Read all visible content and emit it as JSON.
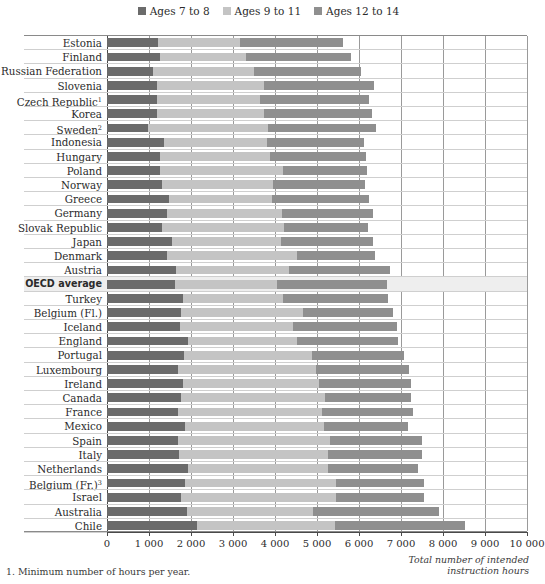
{
  "chart_data": {
    "type": "bar",
    "stacked": true,
    "orientation": "horizontal",
    "title": "",
    "subtitle": "",
    "xlabel": "Total number of intended instruction hours",
    "ylabel": "",
    "xlim": [
      0,
      10000
    ],
    "xticks": [
      0,
      1000,
      2000,
      3000,
      4000,
      5000,
      6000,
      7000,
      8000,
      9000,
      10000
    ],
    "xticklabels": [
      "0",
      "1 000",
      "2 000",
      "3 000",
      "4 000",
      "5 000",
      "6 000",
      "7 000",
      "8 000",
      "9 000",
      "10 000"
    ],
    "grid": "vertical",
    "legend_position": "top-center",
    "legend": [
      {
        "name": "Ages 7 to 8",
        "color": "#6b6b6b"
      },
      {
        "name": "Ages 9 to 11",
        "color": "#c4c4c4"
      },
      {
        "name": "Ages 12 to 14",
        "color": "#8f8f8f"
      }
    ],
    "series": [
      {
        "name": "Ages 7 to 8",
        "color": "#6b6b6b",
        "values": [
          1220,
          1250,
          1100,
          1200,
          1200,
          1180,
          980,
          1360,
          1270,
          1250,
          1300,
          1480,
          1440,
          1320,
          1550,
          1430,
          1650,
          1620,
          1800,
          1760,
          1730,
          1920,
          1830,
          1680,
          1800,
          1760,
          1700,
          1860,
          1700,
          1720,
          1930,
          1850,
          1770,
          1900,
          2140
        ]
      },
      {
        "name": "Ages 9 to 11",
        "color": "#c4c4c4",
        "values": [
          1950,
          2050,
          2400,
          2550,
          2450,
          2550,
          2850,
          2450,
          2600,
          2950,
          2650,
          2450,
          2720,
          2900,
          2600,
          3100,
          2680,
          2430,
          2380,
          2900,
          2700,
          2600,
          3050,
          3300,
          3250,
          3430,
          3430,
          3300,
          3600,
          3550,
          3330,
          3600,
          3680,
          3000,
          3290
        ]
      },
      {
        "name": "Ages 12 to 14",
        "color": "#8f8f8f",
        "values": [
          2450,
          2500,
          2550,
          2600,
          2600,
          2580,
          2570,
          2300,
          2300,
          2000,
          2200,
          2300,
          2180,
          2000,
          2180,
          1850,
          2400,
          2620,
          2520,
          2150,
          2470,
          2400,
          2200,
          2200,
          2200,
          2060,
          2150,
          2000,
          2200,
          2230,
          2150,
          2100,
          2100,
          3000,
          3100
        ]
      }
    ],
    "categories": [
      "Estonia",
      "Finland",
      "Russian Federation",
      "Slovenia",
      "Czech Republic",
      "Korea",
      "Sweden",
      "Indonesia",
      "Hungary",
      "Poland",
      "Norway",
      "Greece",
      "Germany",
      "Slovak Republic",
      "Japan",
      "Denmark",
      "Austria",
      "OECD average",
      "Turkey",
      "Belgium (Fl.)",
      "Iceland",
      "England",
      "Portugal",
      "Luxembourg",
      "Ireland",
      "Canada",
      "France",
      "Mexico",
      "Spain",
      "Italy",
      "Netherlands",
      "Belgium (Fr.)",
      "Israel",
      "Australia",
      "Chile"
    ],
    "category_footnote_markers": {
      "Czech Republic": "1",
      "Sweden": "2",
      "Belgium (Fr.)": "3"
    },
    "highlighted_category": "OECD average",
    "totals": [
      5620,
      5800,
      6050,
      6350,
      6250,
      6310,
      6400,
      6110,
      6170,
      6200,
      6150,
      6230,
      6340,
      6220,
      6330,
      6380,
      6730,
      6670,
      6700,
      6810,
      6900,
      6920,
      7080,
      7180,
      7250,
      7250,
      7280,
      7160,
      7500,
      7500,
      7410,
      7550,
      7550,
      7900,
      8530
    ]
  },
  "footnote": "1. Minimum number of hours per year.",
  "axis_caption_line1": "Total number of intended",
  "axis_caption_line2": "instruction hours"
}
